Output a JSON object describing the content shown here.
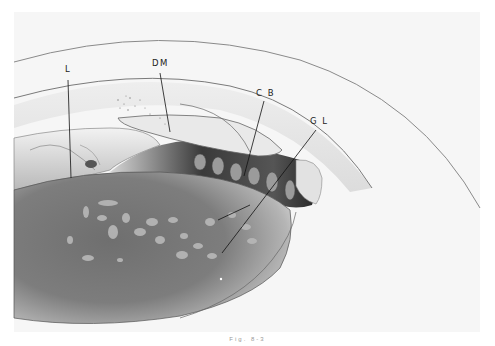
{
  "figure": {
    "type": "medical-illustration",
    "background_color": "#f6f6f6",
    "panel": {
      "x": 14,
      "y": 12,
      "width": 466,
      "height": 320
    },
    "labels": [
      {
        "id": "L",
        "text": "L",
        "x": 65,
        "y": 72,
        "leader": {
          "x1": 68,
          "y1": 80,
          "x2": 71,
          "y2": 178
        }
      },
      {
        "id": "DM",
        "text": "DM",
        "x": 152,
        "y": 66,
        "leader": {
          "x1": 160,
          "y1": 73,
          "x2": 170,
          "y2": 132
        }
      },
      {
        "id": "CB",
        "text": "C B",
        "x": 256,
        "y": 96,
        "leader": {
          "x1": 264,
          "y1": 101,
          "x2": 244,
          "y2": 176
        }
      },
      {
        "id": "GL",
        "text": "G L",
        "x": 310,
        "y": 124,
        "leader": {
          "x1": 316,
          "y1": 130,
          "x2": 222,
          "y2": 253
        },
        "branch": {
          "x1": 250,
          "y1": 205,
          "x2": 218,
          "y2": 220
        }
      }
    ],
    "caption": "Fig. 8-3"
  }
}
